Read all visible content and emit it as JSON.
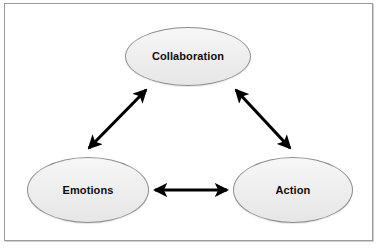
{
  "diagram": {
    "background_color": "#ffffff",
    "frame": {
      "border_color": "#9a9a9a",
      "fill_color": "#ffffff"
    },
    "node_style": {
      "fill_color": "#efefef",
      "border_color": "#8d8d8d",
      "text_color": "#0d0d0d"
    },
    "connector_color": "#000000",
    "nodes": [
      {
        "id": "collaboration",
        "label": "Collaboration",
        "shape": "ellipse",
        "position": "top-center"
      },
      {
        "id": "emotions",
        "label": "Emotions",
        "shape": "ellipse",
        "position": "bottom-left"
      },
      {
        "id": "action",
        "label": "Action",
        "shape": "ellipse",
        "position": "bottom-right"
      }
    ],
    "connectors": [
      {
        "id": "emotions-collaboration",
        "from": "emotions",
        "to": "collaboration",
        "arrowheads": "both",
        "label": ""
      },
      {
        "id": "collaboration-action",
        "from": "collaboration",
        "to": "action",
        "arrowheads": "both",
        "label": ""
      },
      {
        "id": "emotions-action",
        "from": "emotions",
        "to": "action",
        "arrowheads": "both",
        "label": ""
      }
    ]
  }
}
